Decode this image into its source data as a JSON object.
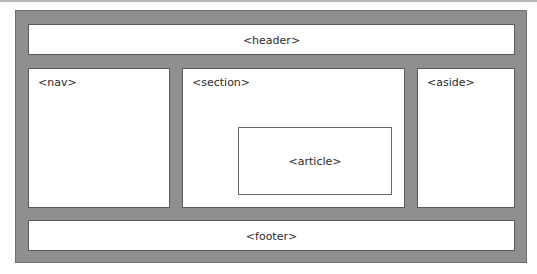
{
  "diagram": {
    "colors": {
      "container_fill": "#8f8f8f",
      "box_fill": "#ffffff",
      "box_border": "#5a5a5a",
      "text": "#2a2a2a"
    },
    "elements": {
      "header": {
        "label": "<header>"
      },
      "nav": {
        "label": "<nav>"
      },
      "section": {
        "label": "<section>"
      },
      "article": {
        "label": "<article>"
      },
      "aside": {
        "label": "<aside>"
      },
      "footer": {
        "label": "<footer>"
      }
    }
  }
}
